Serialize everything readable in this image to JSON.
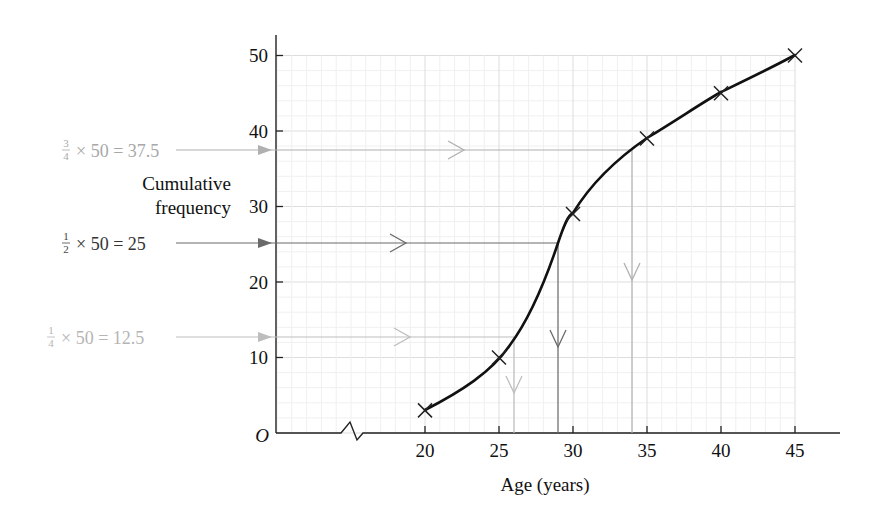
{
  "chart_data": {
    "type": "line",
    "title": "",
    "xlabel": "Age (years)",
    "ylabel": "Cumulative frequency",
    "origin_label": "O",
    "x_ticks": [
      20,
      25,
      30,
      35,
      40,
      45
    ],
    "y_ticks": [
      10,
      20,
      30,
      40,
      50
    ],
    "xlim": [
      20,
      45
    ],
    "ylim": [
      0,
      50
    ],
    "x_axis_break": true,
    "grid": true,
    "series": [
      {
        "name": "Cumulative frequency curve",
        "marker": "x",
        "x": [
          20,
          25,
          30,
          35,
          40,
          45
        ],
        "y": [
          3,
          10,
          29,
          39,
          45,
          50
        ]
      }
    ],
    "annotations": [
      {
        "name": "upper-quartile",
        "fraction_num": "3",
        "fraction_den": "4",
        "expression": "× 50 = 37.5",
        "y": 37.5,
        "x_read": 34,
        "color": "#aaaaaa"
      },
      {
        "name": "median",
        "fraction_num": "1",
        "fraction_den": "2",
        "expression": "× 50 = 25",
        "y": 25,
        "x_read": 29,
        "color": "#666666"
      },
      {
        "name": "lower-quartile",
        "fraction_num": "1",
        "fraction_den": "4",
        "expression": "× 50 = 12.5",
        "y": 12.5,
        "x_read": 26,
        "color": "#b5b5b5"
      }
    ]
  },
  "labels": {
    "ylabel_line1": "Cumulative",
    "ylabel_line2": "frequency",
    "xlabel": "Age (years)",
    "origin": "O",
    "x_ticks": [
      "20",
      "25",
      "30",
      "35",
      "40",
      "45"
    ],
    "y_ticks": [
      "10",
      "20",
      "30",
      "40",
      "50"
    ],
    "uq": {
      "num": "3",
      "den": "4",
      "expr": "× 50 = 37.5"
    },
    "med": {
      "num": "1",
      "den": "2",
      "expr": "× 50 = 25"
    },
    "lq": {
      "num": "1",
      "den": "4",
      "expr": "× 50 = 12.5"
    }
  }
}
